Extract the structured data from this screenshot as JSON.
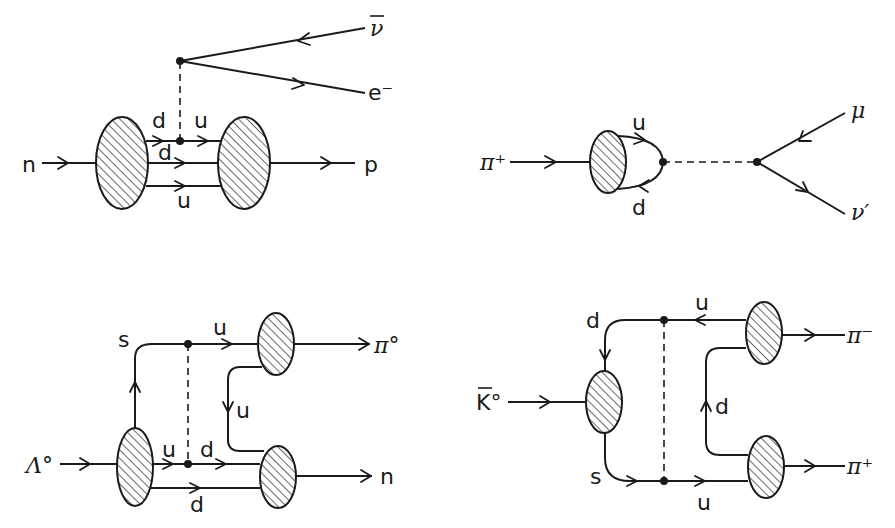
{
  "figure": {
    "diagrams": [
      {
        "name": "neutron-beta-decay",
        "incoming": "n",
        "outgoing": "p",
        "quarks": [
          "d",
          "u",
          "d",
          "u"
        ],
        "leptons": [
          "ν̄",
          "e⁻"
        ]
      },
      {
        "name": "pion-decay",
        "incoming": "π⁺",
        "quarks": [
          "u",
          "d"
        ],
        "leptons": [
          "μ",
          "ν′"
        ]
      },
      {
        "name": "lambda-decay",
        "incoming": "Λ°",
        "outgoing": [
          "π°",
          "n"
        ],
        "quarks": [
          "s",
          "u",
          "u",
          "d",
          "u",
          "d"
        ]
      },
      {
        "name": "kaon-decay",
        "incoming": "K̄°",
        "outgoing": [
          "π⁻",
          "π⁺"
        ],
        "quarks": [
          "d",
          "u",
          "d",
          "s",
          "u"
        ]
      }
    ]
  },
  "labels": {
    "d1_n": "n",
    "d1_p": "p",
    "d1_nubar": "ν",
    "d1_e": "e⁻",
    "d1_d_top": "d",
    "d1_u_top": "u",
    "d1_d_mid": "d",
    "d1_u_bot": "u",
    "d2_pi": "π⁺",
    "d2_u": "u",
    "d2_d": "d",
    "d2_mu": "μ",
    "d2_nu": "ν′",
    "d3_lambda": "Λ°",
    "d3_s": "s",
    "d3_u_top": "u",
    "d3_pi0": "π°",
    "d3_u_mid": "u",
    "d3_u_low": "u",
    "d3_d_low": "d",
    "d3_n": "n",
    "d3_d_bot": "d",
    "d4_k": "K°",
    "d4_d_top": "d",
    "d4_u_top": "u",
    "d4_pim": "π⁻",
    "d4_d_mid": "d",
    "d4_s": "s",
    "d4_u_bot": "u",
    "d4_pip": "π⁺"
  }
}
